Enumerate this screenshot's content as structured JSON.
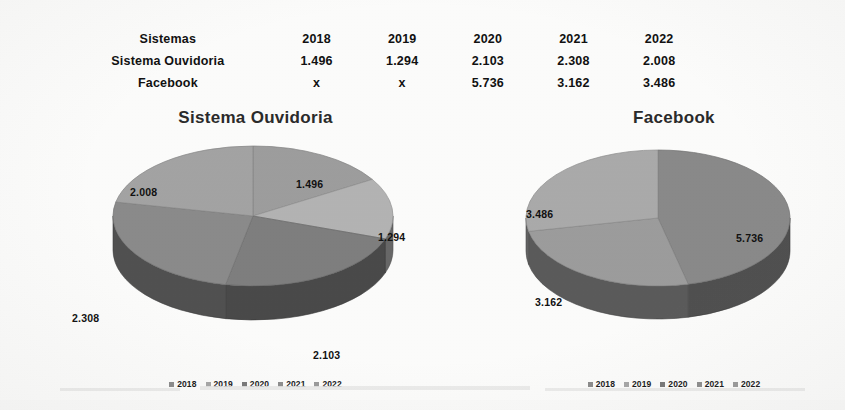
{
  "table": {
    "header": [
      "Sistemas",
      "2018",
      "2019",
      "2020",
      "2021",
      "2022"
    ],
    "rows": [
      {
        "label": "Sistema Ouvidoria",
        "values": [
          "1.496",
          "1.294",
          "2.103",
          "2.308",
          "2.008"
        ]
      },
      {
        "label": "Facebook",
        "values": [
          "x",
          "x",
          "5.736",
          "3.162",
          "3.486"
        ]
      }
    ]
  },
  "legend": {
    "items": [
      {
        "label": "2018",
        "color": "#8c8c8c"
      },
      {
        "label": "2019",
        "color": "#a8a8a8"
      },
      {
        "label": "2020",
        "color": "#7a7a7a"
      },
      {
        "label": "2021",
        "color": "#8f8f8f"
      },
      {
        "label": "2022",
        "color": "#9b9b9b"
      }
    ]
  },
  "charts": [
    {
      "title": "Sistema Ouvidoria"
    },
    {
      "title": "Facebook"
    }
  ],
  "chart_data": [
    {
      "type": "pie",
      "title": "Sistema Ouvidoria",
      "categories": [
        "2018",
        "2019",
        "2020",
        "2021",
        "2022"
      ],
      "values": [
        1496,
        1294,
        2103,
        2308,
        2008
      ],
      "labels": [
        "1.496",
        "1.294",
        "2.103",
        "2.308",
        "2.008"
      ],
      "total": 9209,
      "percents": [
        16.2,
        14.1,
        22.8,
        25.1,
        21.8
      ],
      "colors": [
        "#9e9e9e",
        "#b4b4b4",
        "#7f7f7f",
        "#8b8b8b",
        "#a4a4a4"
      ],
      "legend_position": "bottom",
      "three_d": true,
      "grid": false
    },
    {
      "type": "pie",
      "title": "Facebook",
      "categories": [
        "2020",
        "2021",
        "2022"
      ],
      "values": [
        5736,
        3162,
        3486
      ],
      "labels": [
        "5.736",
        "3.162",
        "3.486"
      ],
      "total": 12384,
      "percents": [
        46.3,
        25.5,
        28.2
      ],
      "colors": [
        "#8a8a8a",
        "#9d9d9d",
        "#ababab"
      ],
      "legend_position": "bottom",
      "three_d": true,
      "grid": false
    }
  ],
  "pie_labels_left": [
    {
      "text": "1.496",
      "x": 238,
      "y": 50
    },
    {
      "text": "1.294",
      "x": 320,
      "y": 103
    },
    {
      "text": "2.103",
      "x": 255,
      "y": 221
    },
    {
      "text": "2.308",
      "x": 14,
      "y": 184
    },
    {
      "text": "2.008",
      "x": 72,
      "y": 58
    }
  ],
  "pie_labels_right": [
    {
      "text": "5.736",
      "x": 256,
      "y": 104
    },
    {
      "text": "3.162",
      "x": 55,
      "y": 168
    },
    {
      "text": "3.486",
      "x": 46,
      "y": 80
    }
  ]
}
